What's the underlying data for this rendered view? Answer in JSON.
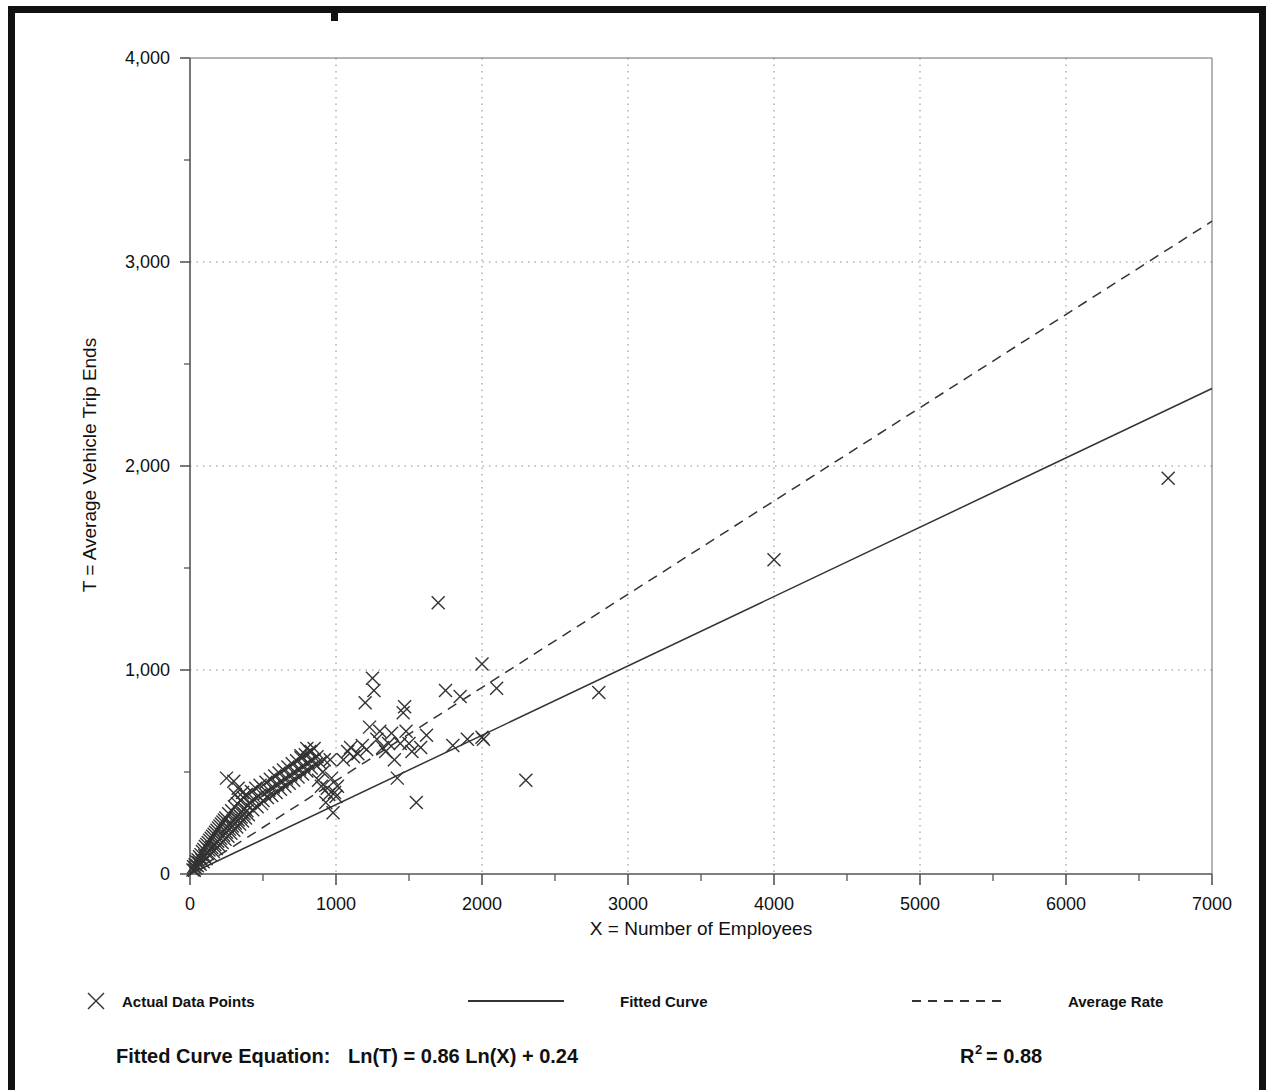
{
  "figure": {
    "background_color": "#ffffff",
    "frame_color": "#111111"
  },
  "axes": {
    "x_title": "X = Number of Employees",
    "y_title": "T = Average Vehicle Trip Ends",
    "x_tick_labels": [
      "0",
      "1000",
      "2000",
      "3000",
      "4000",
      "5000",
      "6000",
      "7000"
    ],
    "y_tick_labels": [
      "0",
      "1,000",
      "2,000",
      "3,000",
      "4,000"
    ]
  },
  "legend": {
    "items": [
      {
        "label": "Actual Data Points",
        "marker": "x-marker",
        "style": "marker"
      },
      {
        "label": "Fitted Curve",
        "marker": "solid-line",
        "style": "solid"
      },
      {
        "label": "Average Rate",
        "marker": "dashed-line",
        "style": "dashed"
      }
    ]
  },
  "equation": {
    "prefix": "Fitted Curve Equation:",
    "formula": "Ln(T) = 0.86 Ln(X) + 0.24",
    "r_symbol": "R",
    "r_exponent": "2",
    "r_value": "= 0.88"
  },
  "chart_data": {
    "type": "scatter",
    "title": "",
    "xlabel": "X = Number of Employees",
    "ylabel": "T = Average Vehicle Trip Ends",
    "xlim": [
      0,
      7000
    ],
    "ylim": [
      0,
      4000
    ],
    "x_major_ticks": [
      0,
      1000,
      2000,
      3000,
      4000,
      5000,
      6000,
      7000
    ],
    "y_major_ticks": [
      0,
      1000,
      2000,
      3000,
      4000
    ],
    "x_minor_tick_step": 500,
    "y_minor_tick_step": 500,
    "grid": "dotted-major-both",
    "legend_position": "below-axes",
    "annotations": [
      "Fitted Curve Equation:  Ln(T) = 0.86 Ln(X) + 0.24",
      "R2 = 0.88"
    ],
    "series": [
      {
        "name": "Actual Data Points",
        "type": "scatter",
        "marker": "x",
        "color": "#333333",
        "points": [
          [
            20,
            20
          ],
          [
            25,
            35
          ],
          [
            30,
            18
          ],
          [
            35,
            45
          ],
          [
            40,
            30
          ],
          [
            45,
            60
          ],
          [
            50,
            40
          ],
          [
            55,
            70
          ],
          [
            60,
            55
          ],
          [
            65,
            85
          ],
          [
            70,
            48
          ],
          [
            75,
            95
          ],
          [
            80,
            70
          ],
          [
            85,
            110
          ],
          [
            90,
            60
          ],
          [
            95,
            120
          ],
          [
            100,
            90
          ],
          [
            105,
            135
          ],
          [
            110,
            75
          ],
          [
            115,
            145
          ],
          [
            120,
            100
          ],
          [
            125,
            155
          ],
          [
            130,
            118
          ],
          [
            135,
            165
          ],
          [
            140,
            95
          ],
          [
            145,
            175
          ],
          [
            150,
            130
          ],
          [
            155,
            185
          ],
          [
            160,
            110
          ],
          [
            165,
            195
          ],
          [
            170,
            145
          ],
          [
            175,
            205
          ],
          [
            180,
            125
          ],
          [
            185,
            215
          ],
          [
            190,
            160
          ],
          [
            195,
            225
          ],
          [
            200,
            140
          ],
          [
            205,
            235
          ],
          [
            210,
            175
          ],
          [
            215,
            245
          ],
          [
            220,
            155
          ],
          [
            225,
            255
          ],
          [
            230,
            190
          ],
          [
            235,
            265
          ],
          [
            240,
            170
          ],
          [
            245,
            275
          ],
          [
            250,
            205
          ],
          [
            255,
            230
          ],
          [
            260,
            185
          ],
          [
            265,
            295
          ],
          [
            270,
            220
          ],
          [
            275,
            245
          ],
          [
            280,
            200
          ],
          [
            285,
            310
          ],
          [
            290,
            235
          ],
          [
            295,
            260
          ],
          [
            300,
            215
          ],
          [
            305,
            330
          ],
          [
            310,
            250
          ],
          [
            315,
            275
          ],
          [
            320,
            230
          ],
          [
            325,
            345
          ],
          [
            330,
            265
          ],
          [
            335,
            290
          ],
          [
            340,
            245
          ],
          [
            345,
            360
          ],
          [
            350,
            280
          ],
          [
            355,
            305
          ],
          [
            360,
            260
          ],
          [
            365,
            375
          ],
          [
            370,
            295
          ],
          [
            375,
            320
          ],
          [
            380,
            275
          ],
          [
            385,
            390
          ],
          [
            390,
            310
          ],
          [
            395,
            335
          ],
          [
            400,
            290
          ],
          [
            410,
            350
          ],
          [
            420,
            405
          ],
          [
            430,
            315
          ],
          [
            440,
            365
          ],
          [
            450,
            420
          ],
          [
            460,
            330
          ],
          [
            470,
            380
          ],
          [
            480,
            435
          ],
          [
            490,
            345
          ],
          [
            250,
            470
          ],
          [
            300,
            455
          ],
          [
            310,
            390
          ],
          [
            330,
            420
          ],
          [
            360,
            400
          ],
          [
            500,
            360
          ],
          [
            510,
            395
          ],
          [
            520,
            450
          ],
          [
            530,
            375
          ],
          [
            540,
            410
          ],
          [
            550,
            465
          ],
          [
            560,
            385
          ],
          [
            570,
            425
          ],
          [
            580,
            480
          ],
          [
            590,
            400
          ],
          [
            600,
            440
          ],
          [
            610,
            495
          ],
          [
            620,
            415
          ],
          [
            630,
            455
          ],
          [
            640,
            510
          ],
          [
            650,
            430
          ],
          [
            660,
            470
          ],
          [
            670,
            525
          ],
          [
            680,
            445
          ],
          [
            690,
            485
          ],
          [
            700,
            540
          ],
          [
            710,
            460
          ],
          [
            720,
            500
          ],
          [
            730,
            555
          ],
          [
            740,
            475
          ],
          [
            750,
            515
          ],
          [
            760,
            570
          ],
          [
            770,
            490
          ],
          [
            780,
            530
          ],
          [
            790,
            585
          ],
          [
            800,
            505
          ],
          [
            810,
            545
          ],
          [
            820,
            600
          ],
          [
            830,
            520
          ],
          [
            840,
            560
          ],
          [
            850,
            615
          ],
          [
            860,
            535
          ],
          [
            870,
            575
          ],
          [
            880,
            460
          ],
          [
            890,
            545
          ],
          [
            900,
            430
          ],
          [
            910,
            500
          ],
          [
            920,
            560
          ],
          [
            930,
            350
          ],
          [
            940,
            420
          ],
          [
            950,
            390
          ],
          [
            960,
            560
          ],
          [
            970,
            470
          ],
          [
            980,
            300
          ],
          [
            990,
            400
          ],
          [
            1000,
            380
          ],
          [
            1010,
            430
          ],
          [
            800,
            615
          ],
          [
            830,
            600
          ],
          [
            760,
            580
          ],
          [
            1050,
            560
          ],
          [
            1080,
            600
          ],
          [
            1100,
            620
          ],
          [
            1120,
            575
          ],
          [
            1150,
            590
          ],
          [
            1180,
            630
          ],
          [
            1200,
            840
          ],
          [
            1210,
            610
          ],
          [
            1230,
            720
          ],
          [
            1250,
            960
          ],
          [
            1260,
            900
          ],
          [
            1280,
            660
          ],
          [
            1300,
            700
          ],
          [
            1320,
            620
          ],
          [
            1340,
            600
          ],
          [
            1360,
            640
          ],
          [
            1380,
            690
          ],
          [
            1400,
            560
          ],
          [
            1420,
            470
          ],
          [
            1440,
            640
          ],
          [
            1460,
            790
          ],
          [
            1470,
            820
          ],
          [
            1480,
            700
          ],
          [
            1500,
            640
          ],
          [
            1520,
            600
          ],
          [
            1550,
            350
          ],
          [
            1580,
            620
          ],
          [
            1620,
            680
          ],
          [
            1700,
            1330
          ],
          [
            1750,
            900
          ],
          [
            1800,
            630
          ],
          [
            1850,
            870
          ],
          [
            1900,
            660
          ],
          [
            2000,
            1030
          ],
          [
            2000,
            670
          ],
          [
            2010,
            660
          ],
          [
            2100,
            910
          ],
          [
            2300,
            460
          ],
          [
            2800,
            890
          ],
          [
            4000,
            1540
          ],
          [
            6700,
            1940
          ]
        ]
      },
      {
        "name": "Fitted Curve",
        "type": "line",
        "style": "solid",
        "color": "#333333",
        "equation": "Ln(T) = 0.86 Ln(X) + 0.24",
        "endpoints": [
          [
            0,
            0
          ],
          [
            7000,
            2380
          ]
        ]
      },
      {
        "name": "Average Rate",
        "type": "line",
        "style": "dashed",
        "color": "#333333",
        "endpoints": [
          [
            0,
            0
          ],
          [
            7000,
            3200
          ]
        ]
      }
    ]
  }
}
